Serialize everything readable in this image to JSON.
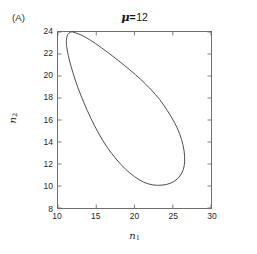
{
  "figure": {
    "panel_label": "(A)",
    "background_color": "#ffffff",
    "axis_color": "#6e6e6e",
    "curve_color": "#4a4a4a",
    "text_color": "#1b1b1b"
  },
  "title": {
    "symbol": "μ",
    "equals": "=",
    "value": "12",
    "full": "μ = 12"
  },
  "axis_labels": {
    "x_base": "n",
    "x_sub": "1",
    "y_base": "n",
    "y_sub": "2"
  },
  "ticks": {
    "x": [
      "10",
      "15",
      "20",
      "25",
      "30"
    ],
    "y": [
      "24",
      "22",
      "20",
      "18",
      "16",
      "14",
      "12",
      "10",
      "8"
    ]
  },
  "chart_data": {
    "type": "line",
    "subtitle": "",
    "xlabel": "n₁",
    "ylabel": "n₂",
    "xlim": [
      10,
      30
    ],
    "ylim": [
      8,
      24
    ],
    "xticks": [
      10,
      15,
      20,
      25,
      30
    ],
    "yticks": [
      8,
      10,
      12,
      14,
      16,
      18,
      20,
      22,
      24
    ],
    "grid": false,
    "legend": false,
    "legend_position": "none",
    "annotations": [
      {
        "text": "(A)",
        "x": "figure-top-left",
        "y": "figure-top-left"
      }
    ],
    "series": [
      {
        "name": "limit cycle",
        "closed": true,
        "color": "#4a4a4a",
        "linewidth": 1,
        "x": [
          12.0,
          13.4,
          14.9,
          16.4,
          17.9,
          19.4,
          20.8,
          22.1,
          23.3,
          24.3,
          25.2,
          25.9,
          26.35,
          26.55,
          26.5,
          26.2,
          25.6,
          24.7,
          23.6,
          22.4,
          21.2,
          20.0,
          18.8,
          17.6,
          16.4,
          15.3,
          14.3,
          13.4,
          12.6,
          11.95,
          11.45,
          11.15,
          11.1,
          11.25,
          11.6,
          11.8
        ],
        "y": [
          24.0,
          23.6,
          22.95,
          22.2,
          21.4,
          20.55,
          19.7,
          18.8,
          17.85,
          16.85,
          15.8,
          14.75,
          13.7,
          12.7,
          11.85,
          11.2,
          10.65,
          10.25,
          10.08,
          10.1,
          10.35,
          10.85,
          11.55,
          12.45,
          13.55,
          14.8,
          16.15,
          17.55,
          18.95,
          20.3,
          21.55,
          22.6,
          23.25,
          23.75,
          23.98,
          24.0
        ]
      }
    ]
  }
}
